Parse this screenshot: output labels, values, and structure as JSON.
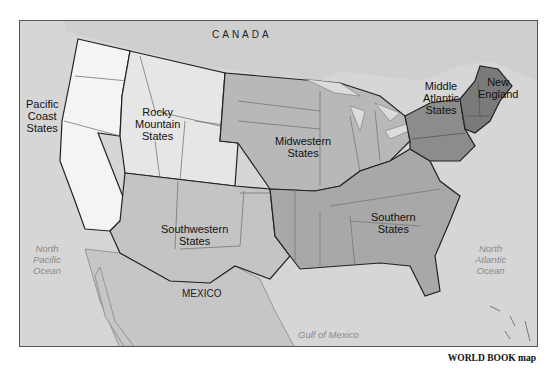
{
  "map": {
    "title_regions": [
      {
        "id": "pacific",
        "label": "Pacific\nCoast\nStates"
      },
      {
        "id": "rocky",
        "label": "Rocky\nMountain\nStates"
      },
      {
        "id": "midwest",
        "label": "Midwestern\nStates"
      },
      {
        "id": "middle_atlantic",
        "label": "Middle\nAtlantic\nStates"
      },
      {
        "id": "new_england",
        "label": "New\nEngland"
      },
      {
        "id": "southwest",
        "label": "Southwestern\nStates"
      },
      {
        "id": "southern",
        "label": "Southern\nStates"
      }
    ],
    "countries": {
      "canada": "CANADA",
      "mexico": "MEXICO"
    },
    "water": {
      "north_pacific": "North\nPacific\nOcean",
      "north_atlantic": "North\nAtlantic\nOcean",
      "gulf": "Gulf of Mexico"
    },
    "colors": {
      "background_land": "#cdcdcd",
      "pacific": "#f4f4f4",
      "rocky": "#e6e6e6",
      "southwest": "#c4c4c4",
      "midwest": "#b8b8b8",
      "southern": "#a8a8a8",
      "middle_atlantic": "#8c8c8c",
      "new_england": "#7a7a7a",
      "water": "#dcdcdc"
    }
  },
  "credit": "WORLD BOOK map"
}
